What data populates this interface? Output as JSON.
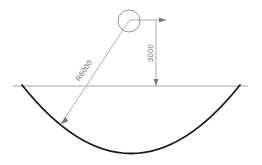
{
  "drawing": {
    "title": "Arc radius and depth dimension drawing",
    "background_color": "#ffffff",
    "arc_color": "#1a1a1a",
    "construction_line_color": "#9a9a9a",
    "text_color": "#6e6e6e",
    "ground_line": {
      "label": "ground-line",
      "x1": 13,
      "y1": 86,
      "x2": 248,
      "y2": 86
    },
    "arc": {
      "label": "channel-arc",
      "start_x": 22,
      "start_y": 85,
      "end_x": 240,
      "end_y": 85,
      "lowest_point_x": 131,
      "lowest_point_y": 152,
      "stroke_width": 1.8
    },
    "center_circle": {
      "label": "arc-center-circle",
      "cx": 129,
      "cy": 21,
      "r": 11,
      "stroke_width": 0.8
    },
    "radius_leader": {
      "label": "radius-leader-line",
      "from_x": 129,
      "from_y": 21,
      "to_x": 61,
      "to_y": 124
    },
    "vertical_dimension": {
      "label": "depth-dimension-line",
      "x": 156,
      "top_y": 20,
      "bottom_y": 86
    },
    "extension_line": {
      "label": "center-extension-line",
      "x1": 129,
      "y1": 20,
      "x2": 166,
      "y2": 20
    }
  },
  "dimensions": {
    "radius": {
      "value": "R6000",
      "text_x": 86,
      "text_y": 72,
      "rotation": -56
    },
    "depth": {
      "value": "3000",
      "text_x": 153,
      "text_y": 53,
      "rotation": -90
    }
  }
}
